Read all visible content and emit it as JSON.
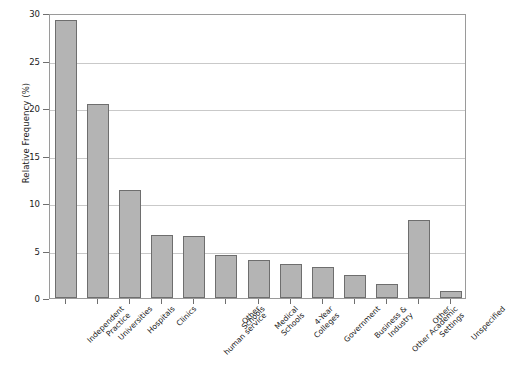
{
  "chart_data": {
    "type": "bar",
    "title": "",
    "subtitle": "",
    "xlabel": "",
    "ylabel": "Relative Frequency (%)",
    "ylim": [
      0,
      30
    ],
    "yticks": [
      0,
      5,
      10,
      15,
      20,
      25,
      30
    ],
    "ytick_labels": [
      "0",
      "5",
      "10",
      "15",
      "20",
      "25",
      "30"
    ],
    "grid": "horizontal",
    "legend": "none",
    "bar_color": "#b4b4b4",
    "bar_edge_color": "#6e6e6e",
    "categories": [
      "Independent Practice",
      "Universities",
      "Hospitals",
      "Clinics",
      "Other human service",
      "Schools",
      "Medical Schools",
      "4-Year Colleges",
      "Government",
      "Business & Industry",
      "Other Academic Settings",
      "Other",
      "Unspecified"
    ],
    "category_lines": [
      [
        "Independent",
        "Practice"
      ],
      [
        "Universities"
      ],
      [
        "Hospitals"
      ],
      [
        "Clinics"
      ],
      [
        "Other",
        "human service"
      ],
      [
        "Schools"
      ],
      [
        "Medical",
        "Schools"
      ],
      [
        "4-Year",
        "Colleges"
      ],
      [
        "Government"
      ],
      [
        "Business &",
        "Industry"
      ],
      [
        "Other Academic",
        "Settings"
      ],
      [
        "Other"
      ],
      [
        "Unspecified"
      ]
    ],
    "values": [
      29.3,
      20.4,
      11.4,
      6.6,
      6.5,
      4.5,
      4.0,
      3.6,
      3.3,
      2.4,
      1.5,
      8.2,
      0.7
    ]
  }
}
